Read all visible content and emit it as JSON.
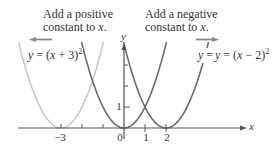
{
  "chart_data": {
    "type": "line",
    "title": "",
    "xlabel": "x",
    "ylabel": "y",
    "xlim": [
      -5,
      6
    ],
    "ylim": [
      0,
      4
    ],
    "grid": false,
    "x_ticks": [
      -3,
      -2,
      -1,
      0,
      1,
      2
    ],
    "x_tick_labels": [
      "−3",
      "0",
      "1",
      "2"
    ],
    "y_ticks": [
      1,
      2,
      3
    ],
    "y_tick_labels": [
      "1"
    ],
    "series": [
      {
        "name": "y = (x + 3)^2",
        "label_text": "y = (x + 3)",
        "exponent": "2",
        "vertex": [
          -3,
          0
        ],
        "shift": 3,
        "color": "#c8c8c8"
      },
      {
        "name": "y = x^2",
        "label_text": "y = x",
        "exponent": "2",
        "vertex": [
          0,
          0
        ],
        "shift": 0,
        "color": "#6a6a6a"
      },
      {
        "name": "y = (x - 2)^2",
        "label_text": "y = (x − 2)",
        "exponent": "2",
        "vertex": [
          2,
          0
        ],
        "shift": -2,
        "color": "#6a6a6a"
      }
    ],
    "annotations": [
      {
        "text_line1": "Add a positive",
        "text_line2": "constant to x.",
        "arrow": "left"
      },
      {
        "text_line1": "Add a negative",
        "text_line2": "constant to x.",
        "arrow": "right"
      }
    ]
  },
  "labels": {
    "x_axis": "x",
    "y_axis": "y",
    "tick_neg3": "−3",
    "tick_0": "0",
    "tick_1": "1",
    "tick_2": "2",
    "ytick_1": "1",
    "annot_left_1": "Add a positive",
    "annot_left_2": "constant to",
    "annot_left_var": "x",
    "annot_right_1": "Add a negative",
    "annot_right_2": "constant to",
    "annot_right_var": "x",
    "eq_left_prefix": "y",
    "eq_left_mid": " = (",
    "eq_left_var": "x",
    "eq_left_suffix": " + 3)",
    "eq_mid_prefix": "y",
    "eq_mid_mid": " = ",
    "eq_mid_var": "x",
    "eq_right_prefix": "y",
    "eq_right_mid": " = (",
    "eq_right_var": "x",
    "eq_right_suffix": " − 2)",
    "exp": "2"
  },
  "colors": {
    "shifted_left_curve": "#c8c8c8",
    "main_curves": "#6a6a6a",
    "axes": "#555555",
    "arrows": "#8a8a8a"
  }
}
